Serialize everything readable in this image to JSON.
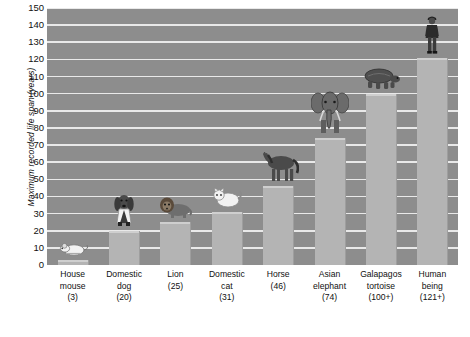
{
  "chart_data": {
    "type": "bar",
    "title": "",
    "xlabel": "",
    "ylabel": "Maximum recorded life span (years)",
    "ylim": [
      0,
      150
    ],
    "ytick_step": 10,
    "yticks": [
      "150",
      "140",
      "130",
      "120",
      "110",
      "100",
      "90",
      "80",
      "70",
      "60",
      "50",
      "40",
      "30",
      "20",
      "10",
      "0"
    ],
    "grid": true,
    "legend": "none",
    "categories": [
      "House mouse",
      "Domestic dog",
      "Lion",
      "Domestic cat",
      "Horse",
      "Asian elephant",
      "Galapagos tortoise",
      "Human being"
    ],
    "value_labels": [
      "(3)",
      "(20)",
      "(25)",
      "(31)",
      "(46)",
      "(74)",
      "(100+)",
      "(121+)"
    ],
    "values": [
      3,
      20,
      25,
      31,
      46,
      74,
      100,
      121
    ],
    "bars": [
      {
        "name": "House mouse",
        "line1": "House",
        "line2": "mouse",
        "value_label": "(3)",
        "value": 3,
        "icon": "mouse-icon"
      },
      {
        "name": "Domestic dog",
        "line1": "Domestic",
        "line2": "dog",
        "value_label": "(20)",
        "value": 20,
        "icon": "dog-icon"
      },
      {
        "name": "Lion",
        "line1": "Lion",
        "line2": "",
        "value_label": "(25)",
        "value": 25,
        "icon": "lion-icon"
      },
      {
        "name": "Domestic cat",
        "line1": "Domestic",
        "line2": "cat",
        "value_label": "(31)",
        "value": 31,
        "icon": "cat-icon"
      },
      {
        "name": "Horse",
        "line1": "Horse",
        "line2": "",
        "value_label": "(46)",
        "value": 46,
        "icon": "horse-icon"
      },
      {
        "name": "Asian elephant",
        "line1": "Asian",
        "line2": "elephant",
        "value_label": "(74)",
        "value": 74,
        "icon": "elephant-icon"
      },
      {
        "name": "Galapagos tortoise",
        "line1": "Galapagos",
        "line2": "tortoise",
        "value_label": "(100+)",
        "value": 100,
        "icon": "tortoise-icon"
      },
      {
        "name": "Human being",
        "line1": "Human",
        "line2": "being",
        "value_label": "(121+)",
        "value": 121,
        "icon": "human-icon"
      }
    ],
    "colors": {
      "plot_background": "#8d8d8d",
      "gridline": "#e9e9e9",
      "bar_fill": "#b4b4b4",
      "bar_edge": "#9e9e9e",
      "text": "#111111",
      "page_background": "#ffffff"
    }
  }
}
